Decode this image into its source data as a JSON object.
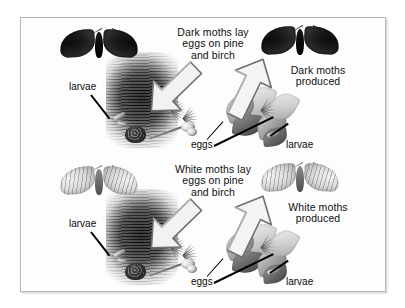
{
  "figure": {
    "frame_color": "#b9b9b9",
    "background_color": "#ffffff",
    "text_color": "#101010"
  },
  "panels": [
    {
      "id": "dark-moth-panel",
      "moth_type": "dark",
      "moth_left_name": "dark-moth-parent",
      "moth_right_name": "dark-moth-offspring",
      "caption_lay": "Dark moths lay\neggs on pine\nand birch",
      "caption_produced": "Dark moths\nproduced",
      "label_larvae_left": "larvae",
      "label_eggs": "eggs",
      "label_larvae_right": "larvae",
      "arrow_down_name": "arrow-lay-eggs",
      "arrow_up_name": "arrow-moths-produced"
    },
    {
      "id": "white-moth-panel",
      "moth_type": "white",
      "moth_left_name": "white-moth-parent",
      "moth_right_name": "white-moth-offspring",
      "caption_lay": "White moths lay\neggs on pine\nand birch",
      "caption_produced": "White moths\nproduced",
      "label_larvae_left": "larvae",
      "label_eggs": "eggs",
      "label_larvae_right": "larvae",
      "arrow_down_name": "arrow-lay-eggs",
      "arrow_up_name": "arrow-moths-produced"
    }
  ]
}
